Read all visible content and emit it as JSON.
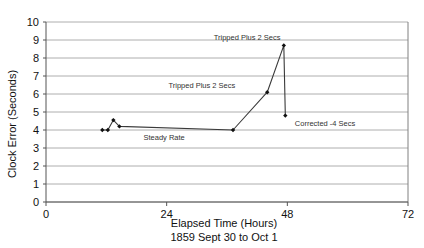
{
  "chart_data": {
    "type": "line",
    "title": "",
    "xlabel": "Elapsed Time (Hours)",
    "xlabel_sub": "1859 Sept 30 to Oct 1",
    "ylabel": "Clock Error (Seconds)",
    "xlim": [
      0,
      72
    ],
    "ylim": [
      0,
      10
    ],
    "xticks": [
      0,
      24,
      48,
      72
    ],
    "xtick_labels": [
      "0",
      "24",
      "48",
      "72"
    ],
    "yticks": [
      0,
      1,
      2,
      3,
      4,
      5,
      6,
      7,
      8,
      9,
      10
    ],
    "ytick_labels": [
      "0",
      "1",
      "2",
      "3",
      "4",
      "5",
      "6",
      "7",
      "8",
      "9",
      "10"
    ],
    "grid": "horizontal",
    "legend": "none",
    "marker": "filled-diamond",
    "line_color": "#3a3a3a",
    "grid_color": "#9a9a9a",
    "frame_color": "#808080",
    "series": [
      {
        "name": "Clock Error",
        "x": [
          11.2,
          12.3,
          13.4,
          14.6,
          37.2,
          44.0,
          47.3,
          47.6
        ],
        "y": [
          4.0,
          4.0,
          4.55,
          4.2,
          4.0,
          6.1,
          8.7,
          4.8
        ]
      }
    ],
    "annotations": [
      {
        "text": "Tripped Plus 2 Secs",
        "x": 40.0,
        "y": 9.0,
        "anchor": "middle"
      },
      {
        "text": "Tripped Plus 2 Secs",
        "x": 31.0,
        "y": 6.35,
        "anchor": "middle"
      },
      {
        "text": "Steady Rate",
        "x": 23.5,
        "y": 3.45,
        "anchor": "middle"
      },
      {
        "text": "Corrected -4 Secs",
        "x": 55.5,
        "y": 4.25,
        "anchor": "middle"
      }
    ]
  }
}
